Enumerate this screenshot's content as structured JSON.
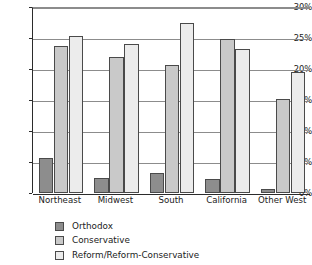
{
  "chart_data": {
    "type": "bar",
    "title": "",
    "subtitle": "",
    "xlabel": "",
    "ylabel": "",
    "ylim": [
      0,
      30
    ],
    "ytick_labels": [
      "0%",
      "5%",
      "10%",
      "15%",
      "20%",
      "25%",
      "30%"
    ],
    "ytick_values": [
      0,
      5,
      10,
      15,
      20,
      25,
      30
    ],
    "grid": true,
    "legend_position": "bottom-left",
    "categories": [
      "Northeast",
      "Midwest",
      "South",
      "California",
      "Other West"
    ],
    "series": [
      {
        "name": "Orthodox",
        "color": "#8d8d8d",
        "values": [
          5.6,
          2.4,
          3.2,
          2.2,
          0.6
        ]
      },
      {
        "name": "Conservative",
        "color": "#c9c9c9",
        "values": [
          23.7,
          22.0,
          20.7,
          24.8,
          15.2
        ]
      },
      {
        "name": "Reform/Reform-Conservative",
        "color": "#ececec",
        "values": [
          25.3,
          24.0,
          27.4,
          23.2,
          19.5
        ]
      }
    ]
  },
  "axes": {
    "y_axis_name": "percentage-axis",
    "x_axis_name": "region-axis"
  }
}
